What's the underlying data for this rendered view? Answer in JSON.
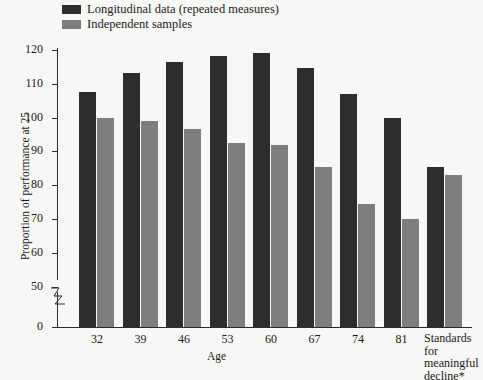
{
  "chart_data": {
    "type": "bar",
    "title": "",
    "subtitle": "",
    "xlabel": "Age",
    "ylabel": "Proportion of performance at 25",
    "categories": [
      "32",
      "39",
      "46",
      "53",
      "60",
      "67",
      "74",
      "81",
      "Standards for meaningful decline*"
    ],
    "category_labels_display": [
      {
        "lines": [
          "32"
        ]
      },
      {
        "lines": [
          "39"
        ]
      },
      {
        "lines": [
          "46"
        ]
      },
      {
        "lines": [
          "53"
        ]
      },
      {
        "lines": [
          "60"
        ]
      },
      {
        "lines": [
          "67"
        ]
      },
      {
        "lines": [
          "74"
        ]
      },
      {
        "lines": [
          "81"
        ]
      },
      {
        "lines": [
          "Standards",
          "for",
          "meaningful",
          "decline*"
        ]
      }
    ],
    "series": [
      {
        "name": "Longitudinal data (repeated measures)",
        "color": "#2d2d2d",
        "values": [
          107.5,
          113,
          116.5,
          118,
          119,
          114.5,
          107,
          100,
          85.5
        ]
      },
      {
        "name": "Independent samples",
        "color": "#7e7e7e",
        "values": [
          100,
          99,
          96.5,
          92.5,
          92,
          85.5,
          74.5,
          70,
          83
        ]
      }
    ],
    "ylim": [
      0,
      120
    ],
    "yticks": [
      0,
      50,
      60,
      70,
      80,
      90,
      100,
      110,
      120
    ],
    "ytick_labels": [
      "0",
      "50",
      "60",
      "70",
      "80",
      "90",
      "100",
      "110",
      "120"
    ],
    "y_axis_break": {
      "present": true,
      "between": [
        0,
        50
      ]
    },
    "grid": false,
    "legend_position": "top-left",
    "background_color": "#f7f7f5",
    "axis_color": "#2a2a2a"
  },
  "legend": {
    "items": [
      {
        "label": "Longitudinal data (repeated measures)",
        "swatch_color": "#2d2d2d"
      },
      {
        "label": "Independent samples",
        "swatch_color": "#7e7e7e"
      }
    ]
  },
  "axes": {
    "x_title": "Age",
    "y_title": "Proportion of performance at 25"
  }
}
